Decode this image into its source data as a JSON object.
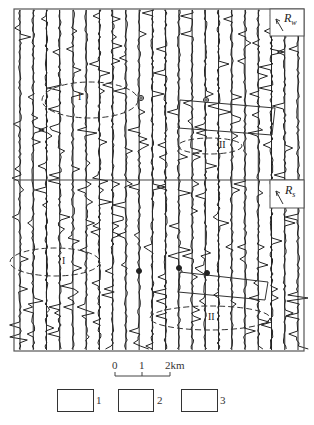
{
  "figure": {
    "panels": [
      {
        "id": "upper",
        "label_main": "R",
        "label_sub": "w"
      },
      {
        "id": "lower",
        "label_main": "R",
        "label_sub": "s"
      }
    ],
    "profile_count": 22,
    "zone_labels": {
      "upper": [
        "I",
        "II"
      ],
      "lower": [
        "I",
        "II"
      ]
    },
    "stroke_color": "#222222"
  },
  "scale_bar": {
    "ticks": [
      "0",
      "1",
      "2km"
    ]
  },
  "legend": {
    "items": [
      {
        "number": "1",
        "symbol": "well-marker"
      },
      {
        "number": "2",
        "symbol": "rectangle-outline"
      },
      {
        "number": "3",
        "symbol": "anomaly-contour"
      }
    ]
  },
  "caption": {
    "text": ""
  }
}
